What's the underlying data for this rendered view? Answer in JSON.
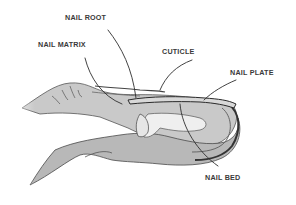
{
  "diagram": {
    "labels": {
      "nail_root": "NAIL ROOT",
      "nail_matrix": "NAIL MATRIX",
      "cuticle": "CUTICLE",
      "nail_plate": "NAIL PLATE",
      "nail_bed": "NAIL BED"
    }
  }
}
